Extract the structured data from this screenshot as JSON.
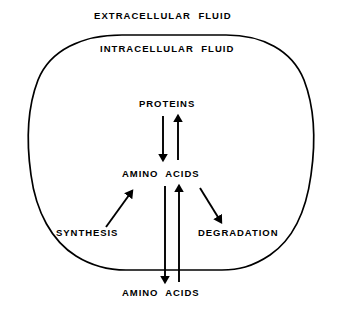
{
  "figure": {
    "background_color": "#ffffff",
    "stroke_color": "#000000"
  },
  "compartments": {
    "extracellular_label": "EXTRACELLULAR  FLUID",
    "intracellular_label": "INTRACELLULAR  FLUID"
  },
  "pools": {
    "proteins_label": "PROTEINS",
    "amino_acids_intracellular_label": "AMINO  ACIDS",
    "amino_acids_extracellular_label": "AMINO  ACIDS"
  },
  "processes": {
    "synthesis_label": "SYNTHESIS",
    "degradation_label": "DEGRADATION"
  },
  "flows": [
    {
      "name": "proteins-to-amino-acids",
      "direction": "down",
      "from": "PROTEINS",
      "to": "AMINO  ACIDS"
    },
    {
      "name": "amino-acids-to-proteins",
      "direction": "up",
      "from": "AMINO  ACIDS",
      "to": "PROTEINS"
    },
    {
      "name": "amino-acid-efflux",
      "direction": "down",
      "from": "AMINO  ACIDS (intracellular)",
      "to": "AMINO  ACIDS (extracellular)"
    },
    {
      "name": "amino-acid-influx",
      "direction": "up",
      "from": "AMINO  ACIDS (extracellular)",
      "to": "AMINO  ACIDS (intracellular)"
    },
    {
      "name": "synthesis-flow",
      "direction": "up-right",
      "from": "SYNTHESIS",
      "to": "AMINO  ACIDS (intracellular)"
    },
    {
      "name": "degradation-flow",
      "direction": "down-right",
      "from": "AMINO  ACIDS (intracellular)",
      "to": "DEGRADATION"
    }
  ]
}
